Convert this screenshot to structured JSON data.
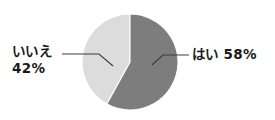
{
  "chart_data": {
    "type": "pie",
    "title": "",
    "subtitle": "",
    "xlabel": "",
    "ylabel": "",
    "legend_position": "none",
    "grid": false,
    "units": "percent",
    "start_angle_deg": 0,
    "direction": "clockwise",
    "categories": [
      "はい",
      "いいえ"
    ],
    "values": [
      58,
      42
    ],
    "colors": [
      "#7d7d7d",
      "#dcdcdc"
    ],
    "slices": [
      {
        "name": "はい",
        "value": 58,
        "value_label": "58%",
        "label": "はい 58%",
        "color": "#7d7d7d",
        "start_angle_deg": 0,
        "end_angle_deg": 208.8
      },
      {
        "name": "いいえ",
        "value": 42,
        "value_label": "42%",
        "label": "いいえ 42%",
        "color": "#dcdcdc",
        "start_angle_deg": 208.8,
        "end_angle_deg": 360
      }
    ]
  },
  "labels": {
    "no": {
      "name": "いいえ",
      "percent": "42%"
    },
    "yes": {
      "text": "はい 58%"
    }
  },
  "style": {
    "background": "#ffffff",
    "text_color": "#1a1a1a",
    "leader_line_color": "#3c3c3c",
    "slice_dark": "#7d7d7d",
    "slice_light": "#dcdcdc",
    "slice_edge": "#ffffff"
  }
}
